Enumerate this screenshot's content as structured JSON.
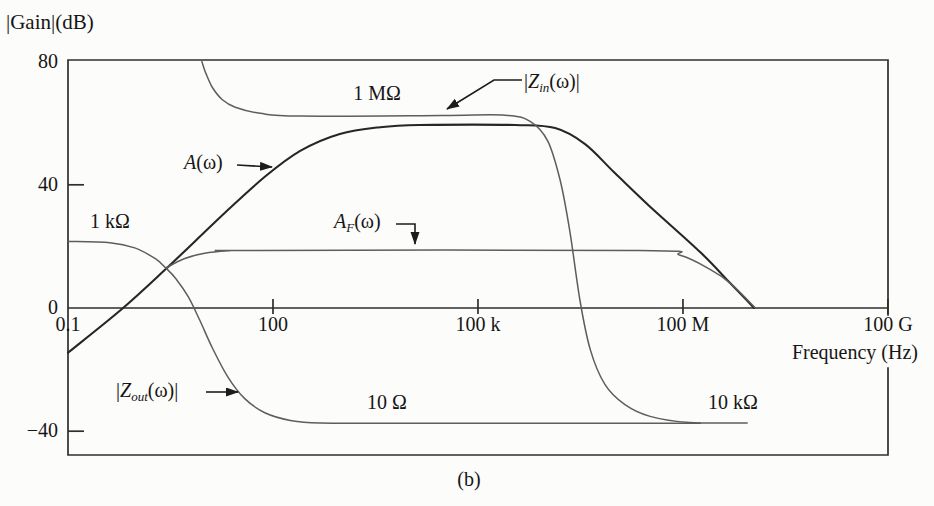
{
  "figure": {
    "gain_axis_label": "|Gain|(dB)",
    "x_axis_label": "Frequency (Hz)",
    "caption": "(b)"
  },
  "labels": {
    "one_mohm": "1 MΩ",
    "one_kohm": "1 kΩ",
    "ten_ohm": "10 Ω",
    "ten_kohm": "10 kΩ",
    "a_main": "A",
    "a_rest": "(ω)",
    "af_main": "A",
    "af_sub": "F",
    "af_rest": "(ω)",
    "zin_bar": "|",
    "zin_main": "Z",
    "zin_sub": "in",
    "zin_rest": "(ω)|",
    "zout_bar": "|",
    "zout_main": "Z",
    "zout_sub": "out",
    "zout_rest": "(ω)|"
  },
  "chart_data": {
    "type": "line",
    "x_scale": "log",
    "x_unit": "Hz",
    "y_unit": "dB",
    "x_range": [
      0.1,
      100000000000.0
    ],
    "ylim": [
      -48,
      80
    ],
    "grid": false,
    "x_ticks": [
      {
        "label": "0.1",
        "f": 0.1
      },
      {
        "label": "100",
        "f": 100
      },
      {
        "label": "100 k",
        "f": 100000.0
      },
      {
        "label": "100 M",
        "f": 100000000.0
      },
      {
        "label": "100 G",
        "f": 100000000000.0
      }
    ],
    "y_ticks": [
      {
        "label": "80",
        "db": 80
      },
      {
        "label": "40",
        "db": 40
      },
      {
        "label": "0",
        "db": 0
      },
      {
        "label": "−40",
        "db": -40
      }
    ],
    "series": [
      {
        "id": "A",
        "name": "A(ω) open-loop gain",
        "color": "#262626",
        "width": 2.1,
        "points": [
          [
            0.1,
            -14.5
          ],
          [
            0.64,
            0
          ],
          [
            2.6,
            12.3
          ],
          [
            20,
            31
          ],
          [
            76,
            42.6
          ],
          [
            250,
            51
          ],
          [
            950,
            56.5
          ],
          [
            3700,
            58.7
          ],
          [
            14000,
            59.4
          ],
          [
            350000.0,
            59.4
          ],
          [
            1350000.0,
            58.4
          ],
          [
            3700000.0,
            53.2
          ],
          [
            10000000.0,
            43.9
          ],
          [
            33000000.0,
            32.9
          ],
          [
            180000000.0,
            18.1
          ],
          [
            490000000.0,
            8.1
          ],
          [
            1100000000.0,
            0
          ]
        ]
      },
      {
        "id": "AF",
        "name": "A_F(ω) closed-loop gain",
        "color": "#5d5d5d",
        "width": 1.5,
        "points": [
          [
            2.7,
            13
          ],
          [
            5,
            16
          ],
          [
            10,
            17.8
          ],
          [
            23,
            18.6
          ],
          [
            46,
            18.7
          ],
          [
            23000000.0,
            18.7
          ],
          [
            91000000.0,
            17.1
          ],
          [
            260000000.0,
            12.3
          ],
          [
            490000000.0,
            8.1
          ],
          [
            1150000000.0,
            0
          ]
        ]
      },
      {
        "id": "Zin",
        "name": "|Z_in(ω)| input impedance (1 MΩ plateau)",
        "color": "#5d5d5d",
        "width": 1.5,
        "points": [
          [
            9.1,
            80
          ],
          [
            10.5,
            76
          ],
          [
            13,
            71.6
          ],
          [
            18,
            67.7
          ],
          [
            28,
            65.2
          ],
          [
            65,
            63.2
          ],
          [
            250,
            62.3
          ],
          [
            30000.0,
            62.5
          ],
          [
            250000.0,
            62.6
          ],
          [
            580000.0,
            60.6
          ],
          [
            1050000.0,
            54.2
          ],
          [
            1600000.0,
            41.3
          ],
          [
            2200000.0,
            25.2
          ],
          [
            3100000.0,
            2.6
          ],
          [
            4400000.0,
            -13.5
          ],
          [
            7200000.0,
            -24.8
          ],
          [
            14000000.0,
            -31.3
          ],
          [
            33000000.0,
            -35.2
          ],
          [
            126000000.0,
            -37.2
          ],
          [
            870000000.0,
            -37.3
          ]
        ]
      },
      {
        "id": "Zout",
        "name": "|Z_out(ω)| output impedance (1 kΩ → 10 Ω → 10 kΩ)",
        "color": "#5d5d5d",
        "width": 1.5,
        "points": [
          [
            0.1,
            21.6
          ],
          [
            0.41,
            21.2
          ],
          [
            0.95,
            19.5
          ],
          [
            1.9,
            16
          ],
          [
            2.7,
            13
          ],
          [
            3.8,
            9.5
          ],
          [
            5.8,
            3.5
          ],
          [
            8.5,
            -4
          ],
          [
            13,
            -13
          ],
          [
            22,
            -22.5
          ],
          [
            39,
            -29.5
          ],
          [
            76,
            -34
          ],
          [
            180,
            -36.5
          ],
          [
            490,
            -37.3
          ],
          [
            10000.0,
            -37.4
          ],
          [
            180000000.0,
            -37.4
          ]
        ]
      }
    ],
    "annotations": {
      "zin_plateau_value": "1 MΩ",
      "zout_low_freq_value": "1 kΩ",
      "zout_midband_value": "10 Ω",
      "high_freq_value": "10 kΩ"
    }
  }
}
